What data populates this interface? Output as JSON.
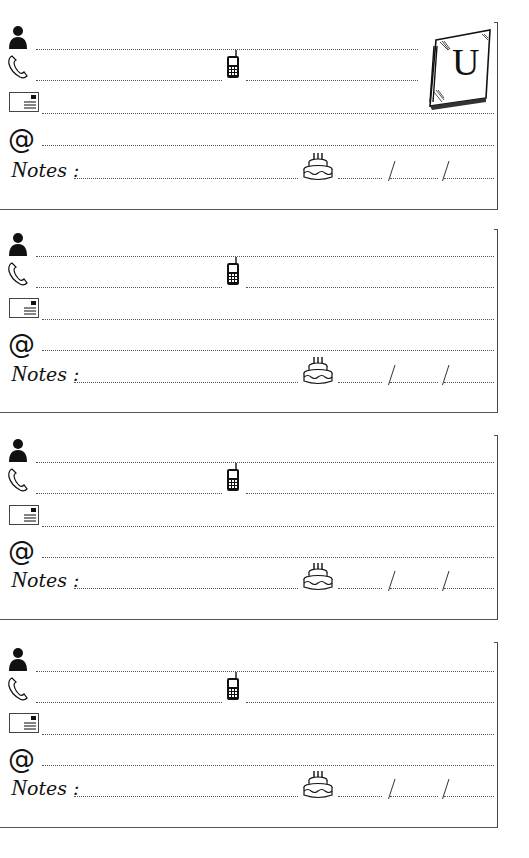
{
  "page": {
    "section_letter": "U",
    "colors": {
      "ink": "#111111",
      "line": "#555555",
      "paper": "#ffffff"
    }
  },
  "labels": {
    "notes": "Notes :",
    "notes_initial": "N",
    "notes_rest": "otes :",
    "email_symbol": "@",
    "date_separator": "/"
  },
  "icons": {
    "name": "person-icon",
    "phone": "phone-handset-icon",
    "mobile": "mobile-phone-icon",
    "address": "envelope-icon",
    "email": "at-sign-icon",
    "birthday": "birthday-cake-icon",
    "tab": "notebook-letter-icon"
  },
  "cards": [
    {
      "index": 1,
      "name": "",
      "phone": "",
      "mobile": "",
      "address": "",
      "email": "",
      "notes": "",
      "birthday": {
        "day": "",
        "month": "",
        "year": ""
      }
    },
    {
      "index": 2,
      "name": "",
      "phone": "",
      "mobile": "",
      "address": "",
      "email": "",
      "notes": "",
      "birthday": {
        "day": "",
        "month": "",
        "year": ""
      }
    },
    {
      "index": 3,
      "name": "",
      "phone": "",
      "mobile": "",
      "address": "",
      "email": "",
      "notes": "",
      "birthday": {
        "day": "",
        "month": "",
        "year": ""
      }
    },
    {
      "index": 4,
      "name": "",
      "phone": "",
      "mobile": "",
      "address": "",
      "email": "",
      "notes": "",
      "birthday": {
        "day": "",
        "month": "",
        "year": ""
      }
    }
  ]
}
